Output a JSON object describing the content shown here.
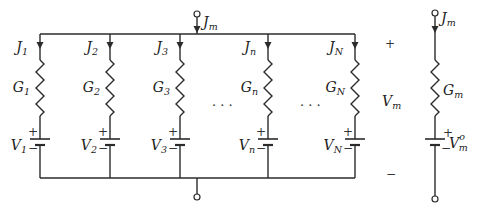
{
  "diagram": {
    "type": "parallel-battery-circuit",
    "input_current": {
      "symbol": "J",
      "subscript": "m"
    },
    "ellipsis": "· · ·",
    "branches": [
      {
        "current": {
          "symbol": "J",
          "subscript": "1"
        },
        "conductance": {
          "symbol": "G",
          "subscript": "1"
        },
        "voltage": {
          "symbol": "V",
          "subscript": "1"
        }
      },
      {
        "current": {
          "symbol": "J",
          "subscript": "2"
        },
        "conductance": {
          "symbol": "G",
          "subscript": "2"
        },
        "voltage": {
          "symbol": "V",
          "subscript": "2"
        }
      },
      {
        "current": {
          "symbol": "J",
          "subscript": "3"
        },
        "conductance": {
          "symbol": "G",
          "subscript": "3"
        },
        "voltage": {
          "symbol": "V",
          "subscript": "3"
        }
      },
      {
        "current": {
          "symbol": "J",
          "subscript": "n"
        },
        "conductance": {
          "symbol": "G",
          "subscript": "n"
        },
        "voltage": {
          "symbol": "V",
          "subscript": "n"
        }
      },
      {
        "current": {
          "symbol": "J",
          "subscript": "N"
        },
        "conductance": {
          "symbol": "G",
          "subscript": "N"
        },
        "voltage": {
          "symbol": "V",
          "subscript": "N"
        }
      }
    ],
    "terminal_voltage": {
      "symbol": "V",
      "subscript": "m",
      "plus": "+",
      "minus": "−"
    },
    "equivalent": {
      "current": {
        "symbol": "J",
        "subscript": "m"
      },
      "conductance": {
        "symbol": "G",
        "subscript": "m"
      },
      "voltage": {
        "symbol": "V",
        "subscript": "m",
        "superscript": "o"
      }
    },
    "battery_plus": "+",
    "battery_minus": "−"
  }
}
